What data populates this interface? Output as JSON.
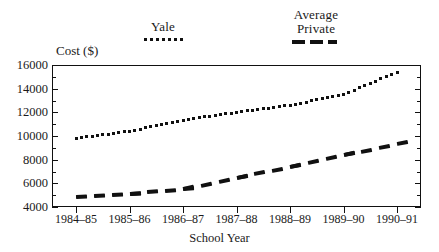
{
  "chart_data": {
    "type": "line",
    "title": "",
    "xlabel": "School Year",
    "ylabel": "Cost ($)",
    "categories": [
      "1984–85",
      "1985–86",
      "1986–87",
      "1987–88",
      "1988–89",
      "1989–90",
      "1990–91"
    ],
    "ylim": [
      4000,
      16000
    ],
    "ytick_labels": [
      "16000",
      "14000",
      "12000",
      "10000",
      "8000",
      "6000",
      "4000"
    ],
    "ytick_values": [
      16000,
      14000,
      12000,
      10000,
      8000,
      6000,
      4000
    ],
    "grid": false,
    "legend_position": "above-plot",
    "series": [
      {
        "name": "Yale",
        "style": "dotted",
        "values": [
          9800,
          10400,
          11350,
          12000,
          12600,
          13500,
          15400
        ]
      },
      {
        "name": "Average Private",
        "style": "dashed",
        "values": [
          4900,
          5150,
          5500,
          6500,
          7400,
          8400,
          9300
        ]
      }
    ]
  },
  "legend": {
    "yale": {
      "label": "Yale",
      "marker": "dotted-line-sample"
    },
    "average_private": {
      "line1": "Average",
      "line2": "Private",
      "marker": "dashed-line-sample"
    }
  },
  "axes": {
    "y_axis_title": "Cost ($)",
    "x_axis_title": "School Year"
  }
}
